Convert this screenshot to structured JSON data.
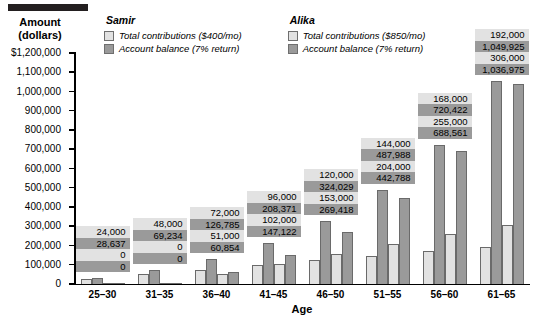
{
  "y_axis": {
    "title_line1": "Amount",
    "title_line2": "(dollars)",
    "ticks": [
      "$1,200,000",
      "1,100,000",
      "1,000,000",
      "900,000",
      "800,000",
      "700,000",
      "600,000",
      "500,000",
      "400,000",
      "300,000",
      "200,000",
      "100,000",
      "0"
    ]
  },
  "x_axis": {
    "title": "Age"
  },
  "legend": {
    "groups": [
      {
        "name": "Samir",
        "entries": [
          {
            "label": "Total contributions ($400/mo)",
            "swatch": "light",
            "color": "#e2e2e2"
          },
          {
            "label": "Account balance (7% return)",
            "swatch": "dark",
            "color": "#9a9a9a"
          }
        ]
      },
      {
        "name": "Alika",
        "entries": [
          {
            "label": "Total contributions ($850/mo)",
            "swatch": "light",
            "color": "#e2e2e2"
          },
          {
            "label": "Account balance (7% return)",
            "swatch": "dark",
            "color": "#9a9a9a"
          }
        ]
      }
    ]
  },
  "chart_data": {
    "type": "bar",
    "title": "",
    "xlabel": "Age",
    "ylabel": "Amount (dollars)",
    "ylim": [
      0,
      1200000
    ],
    "ytick_step": 100000,
    "grid": false,
    "legend_position": "top",
    "categories": [
      "25–30",
      "31–35",
      "36–40",
      "41–45",
      "46–50",
      "51–55",
      "56–60",
      "61–65"
    ],
    "series": [
      {
        "name": "Samir — Total contributions ($400/mo)",
        "color": "#e2e2e2",
        "values": [
          24000,
          48000,
          72000,
          96000,
          120000,
          144000,
          168000,
          192000
        ]
      },
      {
        "name": "Samir — Account balance (7% return)",
        "color": "#9a9a9a",
        "values": [
          28637,
          69234,
          126785,
          208371,
          324029,
          487988,
          720422,
          1049925
        ]
      },
      {
        "name": "Alika — Total contributions ($850/mo)",
        "color": "#e2e2e2",
        "values": [
          0,
          0,
          51000,
          102000,
          153000,
          204000,
          255000,
          306000
        ]
      },
      {
        "name": "Alika — Account balance (7% return)",
        "color": "#9a9a9a",
        "values": [
          0,
          0,
          60854,
          147122,
          269418,
          442788,
          688561,
          1036975
        ]
      }
    ],
    "data_labels": [
      [
        "24,000",
        "28,637",
        "0",
        "0"
      ],
      [
        "48,000",
        "69,234",
        "0",
        "0"
      ],
      [
        "72,000",
        "126,785",
        "51,000",
        "60,854"
      ],
      [
        "96,000",
        "208,371",
        "102,000",
        "147,122"
      ],
      [
        "120,000",
        "324,029",
        "153,000",
        "269,418"
      ],
      [
        "144,000",
        "487,988",
        "204,000",
        "442,788"
      ],
      [
        "168,000",
        "720,422",
        "255,000",
        "688,561"
      ],
      [
        "192,000",
        "1,049,925",
        "306,000",
        "1,036,975"
      ]
    ]
  }
}
